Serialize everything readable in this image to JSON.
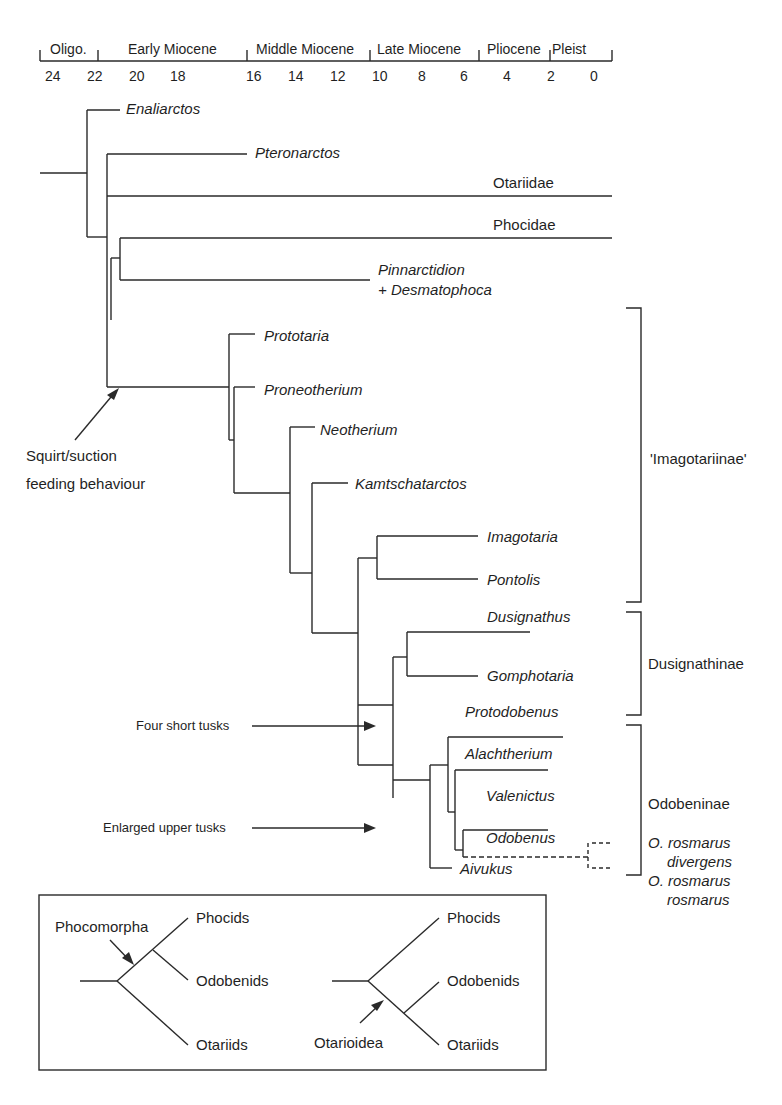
{
  "timescale": {
    "epochs": [
      {
        "label": "Oligo.",
        "x": 55
      },
      {
        "label": "Early Miocene",
        "x": 128
      },
      {
        "label": "Middle Miocene",
        "x": 255
      },
      {
        "label": "Late Miocene",
        "x": 380
      },
      {
        "label": "Pliocene",
        "x": 488
      },
      {
        "label": "Pleist",
        "x": 553
      }
    ],
    "ticks": [
      "24",
      "22",
      "20",
      "18",
      "16",
      "14",
      "12",
      "10",
      "8",
      "6",
      "4",
      "2",
      "0"
    ],
    "unit_note": "Ma"
  },
  "taxa": [
    {
      "name": "Enaliarctos",
      "italic": true
    },
    {
      "name": "Pteronarctos",
      "italic": true
    },
    {
      "name": "Otariidae",
      "italic": false
    },
    {
      "name": "Phocidae",
      "italic": false
    },
    {
      "name": "Pinnarctidion",
      "italic": true
    },
    {
      "name": "+ Desmatophoca",
      "italic": true
    },
    {
      "name": "Prototaria",
      "italic": true
    },
    {
      "name": "Proneotherium",
      "italic": true
    },
    {
      "name": "Neotherium",
      "italic": true
    },
    {
      "name": "Kamtschatarctos",
      "italic": true
    },
    {
      "name": "Imagotaria",
      "italic": true
    },
    {
      "name": "Pontolis",
      "italic": true
    },
    {
      "name": "Dusignathus",
      "italic": true
    },
    {
      "name": "Gomphotaria",
      "italic": true
    },
    {
      "name": "Protodobenus",
      "italic": true
    },
    {
      "name": "Alachtherium",
      "italic": true
    },
    {
      "name": "Valenictus",
      "italic": true
    },
    {
      "name": "Odobenus",
      "italic": true
    },
    {
      "name": "Aivukus",
      "italic": true
    }
  ],
  "clades": [
    {
      "name": "'Imagotariinae'"
    },
    {
      "name": "Dusignathinae"
    },
    {
      "name": "Odobeninae"
    }
  ],
  "subspecies": [
    {
      "line1": "O. rosmarus",
      "line2": "divergens"
    },
    {
      "line1": "O. rosmarus",
      "line2": "rosmarus"
    }
  ],
  "annotations": {
    "squirt_line1": "Squirt/suction",
    "squirt_line2": "feeding behaviour",
    "four_tusks": "Four short tusks",
    "enlarged_tusks": "Enlarged upper tusks"
  },
  "inset": {
    "left": {
      "node_label": "Phocomorpha",
      "tips": [
        "Phocids",
        "Odobenids",
        "Otariids"
      ]
    },
    "right": {
      "node_label": "Otarioidea",
      "tips": [
        "Phocids",
        "Odobenids",
        "Otariids"
      ]
    }
  },
  "colors": {
    "line": "#2a2a2a",
    "text": "#1f1f1f",
    "background": "#ffffff"
  }
}
